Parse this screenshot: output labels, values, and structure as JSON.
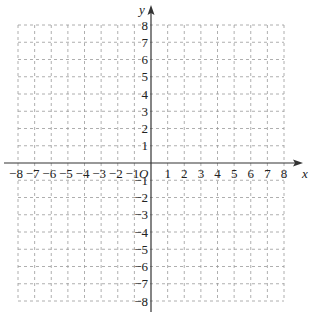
{
  "figure": {
    "type": "coordinate-plane",
    "x_axis_label": "x",
    "y_axis_label": "y",
    "origin_label": "O",
    "x_range": [
      -8,
      8
    ],
    "y_range": [
      -8,
      8
    ],
    "x_ticks": [
      {
        "value": -8,
        "label": "−8"
      },
      {
        "value": -7,
        "label": "−7"
      },
      {
        "value": -6,
        "label": "−6"
      },
      {
        "value": -5,
        "label": "−5"
      },
      {
        "value": -4,
        "label": "−4"
      },
      {
        "value": -3,
        "label": "−3"
      },
      {
        "value": -2,
        "label": "−2"
      },
      {
        "value": -1,
        "label": "−1"
      },
      {
        "value": 1,
        "label": "1"
      },
      {
        "value": 2,
        "label": "2"
      },
      {
        "value": 3,
        "label": "3"
      },
      {
        "value": 4,
        "label": "4"
      },
      {
        "value": 5,
        "label": "5"
      },
      {
        "value": 6,
        "label": "6"
      },
      {
        "value": 7,
        "label": "7"
      },
      {
        "value": 8,
        "label": "8"
      }
    ],
    "y_ticks": [
      {
        "value": 8,
        "label": "8"
      },
      {
        "value": 7,
        "label": "7"
      },
      {
        "value": 6,
        "label": "6"
      },
      {
        "value": 5,
        "label": "5"
      },
      {
        "value": 4,
        "label": "4"
      },
      {
        "value": 3,
        "label": "3"
      },
      {
        "value": 2,
        "label": "2"
      },
      {
        "value": 1,
        "label": "1"
      },
      {
        "value": -1,
        "label": "−1"
      },
      {
        "value": -2,
        "label": "−2"
      },
      {
        "value": -3,
        "label": "−3"
      },
      {
        "value": -4,
        "label": "−4"
      },
      {
        "value": -5,
        "label": "−5"
      },
      {
        "value": -6,
        "label": "−6"
      },
      {
        "value": -7,
        "label": "−7"
      },
      {
        "value": -8,
        "label": "−8"
      }
    ],
    "grid": {
      "style": "dashed",
      "color": "#9a9a9a"
    },
    "axis_color": "#333333"
  }
}
